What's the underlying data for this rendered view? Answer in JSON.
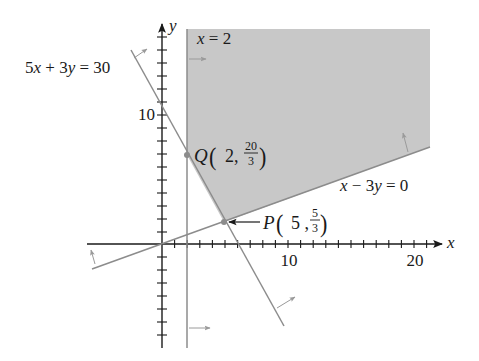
{
  "figure": {
    "type": "linear-programming feasible region",
    "axes": {
      "x_label": "x",
      "y_label": "y",
      "x_tick_labels": [
        "10",
        "20"
      ],
      "y_tick_labels": [
        "10"
      ],
      "x_range": [
        -6,
        22
      ],
      "y_range": [
        -8,
        17
      ]
    },
    "constraints": [
      {
        "id": "c1",
        "equation": "5x + 3y = 30",
        "label_parts": [
          "5",
          "x",
          " + 3",
          "y",
          " = 30"
        ],
        "feasible_side": ">="
      },
      {
        "id": "c2",
        "equation": "x = 2",
        "label_parts": [
          "x",
          " = 2"
        ],
        "feasible_side": ">="
      },
      {
        "id": "c3",
        "equation": "x − 3y = 0",
        "label_parts": [
          "x",
          " − 3",
          "y",
          " = 0"
        ],
        "feasible_side": "<="
      }
    ],
    "vertices": [
      {
        "name": "Q",
        "x": "2",
        "y_num": "20",
        "y_den": "3"
      },
      {
        "name": "P",
        "x": "5",
        "y_num": "5",
        "y_den": "3"
      }
    ],
    "colors": {
      "region_fill": "#c8c8c8",
      "constraint_line": "#8c8c8c",
      "arrow": "#9a9a9a",
      "axis": "#1a1a1a",
      "point": "#8c8c8c"
    }
  }
}
